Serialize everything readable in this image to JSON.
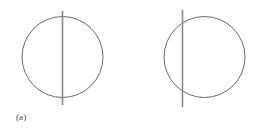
{
  "figure": {
    "background_color": "#ffffff",
    "stroke_color": "#6b6b6b",
    "line_color": "#8a8a8a",
    "caption_color": "#4a4a4a",
    "panels": [
      {
        "id": "a",
        "caption": "(a)",
        "shape": "circle-with-vertical-diameter",
        "circle": {
          "cx": 62.5,
          "cy": 57,
          "r": 40.5
        },
        "line": {
          "x": 62.5,
          "y1": 11,
          "y2": 105
        },
        "line_label": "diameter"
      },
      {
        "id": "b",
        "caption": "(b)",
        "shape": "circle-with-vertical-chord",
        "circle": {
          "cx": 204.5,
          "cy": 57,
          "r": 40.5
        },
        "line": {
          "x": 182.5,
          "y1": 10,
          "y2": 107
        },
        "line_label": "chord"
      }
    ]
  },
  "chart_data": {
    "type": "diagram",
    "title": "",
    "subtitle": "",
    "items": [
      {
        "label": "(a)",
        "circle_center": [
          62.5,
          57
        ],
        "circle_radius": 40.5,
        "line_x": 62.5,
        "line_y_start": 11,
        "line_y_end": 105,
        "line_type": "diameter",
        "offset_from_center": 0
      },
      {
        "label": "(b)",
        "circle_center": [
          204.5,
          57
        ],
        "circle_radius": 40.5,
        "line_x": 182.5,
        "line_y_start": 10,
        "line_y_end": 107,
        "line_type": "chord",
        "offset_from_center": -22
      }
    ],
    "legend": [],
    "xlabel": "",
    "ylabel": "",
    "grid": false
  }
}
